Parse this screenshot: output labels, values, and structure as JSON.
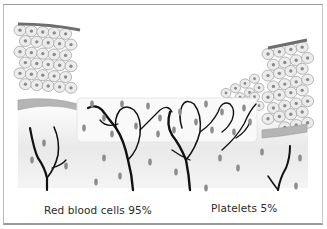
{
  "figure": {
    "captions": {
      "left": "Red blood cells 95%",
      "right": "Platelets 5%"
    },
    "colors": {
      "frame_border": "#9a9a9a",
      "cell_fill": "#ececec",
      "cell_outline": "#9c9c9c",
      "nucleus": "#8a8a8a",
      "basal_layer": "#b5b5b5",
      "surface_layer": "#6e6e6e",
      "vessel": "#111111",
      "blood_cell": "#8c8c8c",
      "panel_fill": "#f7f7f7",
      "dermis_shade": "#e6e6e6"
    }
  }
}
